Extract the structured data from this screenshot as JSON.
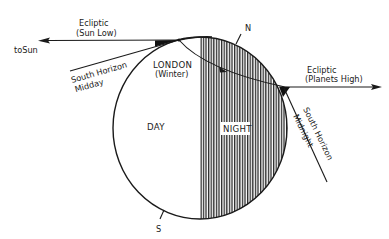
{
  "diagram": {
    "type": "astronomy-schematic",
    "colors": {
      "ink": "#1a1a1a",
      "background": "#ffffff",
      "night_hatch": "#2a2a2a"
    },
    "labels": {
      "ecliptic_left_line1": "Ecliptic",
      "ecliptic_left_line2": "(Sun Low)",
      "to_sun": "toSun",
      "south_horizon_midday_line1": "South Horizon",
      "south_horizon_midday_line2": "Midday",
      "london_line1": "LONDON",
      "london_line2": "(Winter)",
      "north": "N",
      "south": "S",
      "day": "DAY",
      "night": "NIGHT",
      "ecliptic_right_line1": "Ecliptic",
      "ecliptic_right_line2": "(Planets High)",
      "south_horizon_midnight_line1": "South Horizon",
      "south_horizon_midnight_line2": "Midnight"
    },
    "nodes": [
      {
        "id": "earth",
        "shape": "circle",
        "regions": [
          "day",
          "night"
        ]
      },
      {
        "id": "london-midday",
        "position": "upper-left of earth"
      },
      {
        "id": "london-midnight",
        "position": "right of earth"
      }
    ],
    "edges": [
      {
        "from": "london-midday",
        "to": "sun",
        "label": "Ecliptic (Sun Low)",
        "arrow": true
      },
      {
        "from": "london-midday",
        "to": "london-midnight",
        "label": "rotation path",
        "arrow": true
      },
      {
        "from": "london-midnight",
        "to": "right",
        "label": "Ecliptic (Planets High)",
        "arrow": true
      }
    ]
  }
}
